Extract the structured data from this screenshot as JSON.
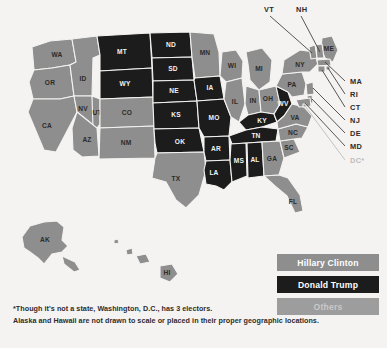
{
  "colors": {
    "background": "#f4f3f1",
    "clinton": "#8e8e8e",
    "trump": "#1c1c1c",
    "others": "#9d9d9d",
    "label_light": "#f2f2f2",
    "label_dark": "#2b2b2b",
    "dc_gray": "#bdbdbd"
  },
  "map": {
    "title": "2016 United States presidential election electoral map",
    "states": [
      {
        "code": "WA",
        "winner": "clinton"
      },
      {
        "code": "OR",
        "winner": "clinton"
      },
      {
        "code": "CA",
        "winner": "clinton"
      },
      {
        "code": "NV",
        "winner": "clinton"
      },
      {
        "code": "ID",
        "winner": "clinton"
      },
      {
        "code": "MT",
        "winner": "trump"
      },
      {
        "code": "WY",
        "winner": "trump"
      },
      {
        "code": "UT",
        "winner": "clinton"
      },
      {
        "code": "AZ",
        "winner": "clinton"
      },
      {
        "code": "CO",
        "winner": "clinton"
      },
      {
        "code": "NM",
        "winner": "clinton"
      },
      {
        "code": "ND",
        "winner": "trump"
      },
      {
        "code": "SD",
        "winner": "trump"
      },
      {
        "code": "NE",
        "winner": "trump"
      },
      {
        "code": "KS",
        "winner": "trump"
      },
      {
        "code": "OK",
        "winner": "trump"
      },
      {
        "code": "TX",
        "winner": "clinton"
      },
      {
        "code": "MN",
        "winner": "clinton"
      },
      {
        "code": "IA",
        "winner": "trump"
      },
      {
        "code": "MO",
        "winner": "trump"
      },
      {
        "code": "AR",
        "winner": "trump"
      },
      {
        "code": "LA",
        "winner": "trump"
      },
      {
        "code": "WI",
        "winner": "clinton"
      },
      {
        "code": "IL",
        "winner": "clinton"
      },
      {
        "code": "MS",
        "winner": "trump"
      },
      {
        "code": "AL",
        "winner": "trump"
      },
      {
        "code": "MI",
        "winner": "clinton"
      },
      {
        "code": "IN",
        "winner": "clinton"
      },
      {
        "code": "OH",
        "winner": "clinton"
      },
      {
        "code": "KY",
        "winner": "trump"
      },
      {
        "code": "TN",
        "winner": "trump"
      },
      {
        "code": "GA",
        "winner": "clinton"
      },
      {
        "code": "FL",
        "winner": "clinton"
      },
      {
        "code": "SC",
        "winner": "clinton"
      },
      {
        "code": "NC",
        "winner": "clinton"
      },
      {
        "code": "VA",
        "winner": "clinton"
      },
      {
        "code": "WV",
        "winner": "trump"
      },
      {
        "code": "PA",
        "winner": "clinton"
      },
      {
        "code": "NY",
        "winner": "clinton"
      },
      {
        "code": "ME",
        "winner": "clinton"
      },
      {
        "code": "AK",
        "winner": "clinton"
      },
      {
        "code": "HI",
        "winner": "clinton"
      }
    ],
    "callouts": [
      {
        "code": "VT",
        "style": "normal"
      },
      {
        "code": "NH",
        "style": "normal"
      },
      {
        "code": "MA",
        "style": "normal"
      },
      {
        "code": "RI",
        "style": "normal"
      },
      {
        "code": "CT",
        "style": "normal"
      },
      {
        "code": "NJ",
        "style": "normal"
      },
      {
        "code": "DE",
        "style": "normal"
      },
      {
        "code": "MD",
        "style": "normal"
      },
      {
        "code": "DC*",
        "style": "muted"
      }
    ]
  },
  "legend": {
    "items": [
      {
        "label": "Hillary Clinton",
        "key": "clinton"
      },
      {
        "label": "Donald Trump",
        "key": "trump"
      },
      {
        "label": "Others",
        "key": "others"
      }
    ]
  },
  "footnote": {
    "line1": "*Though it's not a state, Washington, D.C., has 3 electors.",
    "line2": "Alaska and Hawaii are not drawn to scale or placed in their proper geographic locations."
  }
}
